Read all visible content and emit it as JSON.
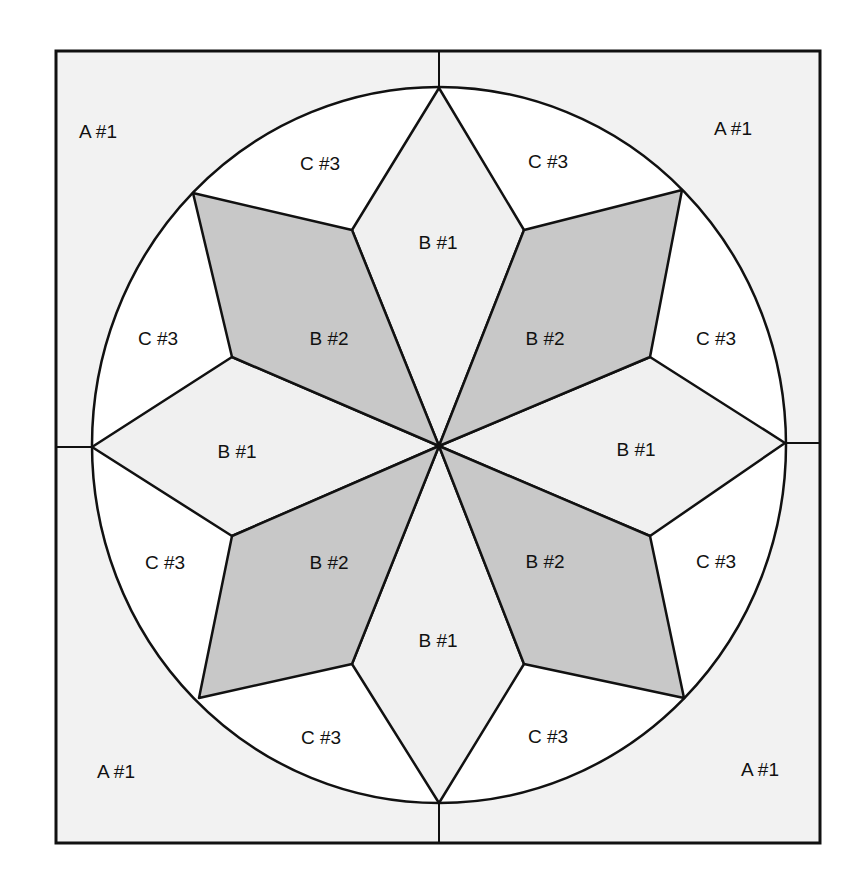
{
  "diagram": {
    "colors": {
      "background_a": "#f2f2f2",
      "piece_b1": "#f0f0f0",
      "piece_b2": "#c8c8c8",
      "piece_c3": "#ffffff",
      "outline": "#111111"
    },
    "labels": {
      "a_top_left": "A #1",
      "a_top_right": "A #1",
      "a_bottom_left": "A #1",
      "a_bottom_right": "A #1",
      "c_top_left": "C #3",
      "c_top_right": "C #3",
      "c_left_upper": "C #3",
      "c_right_upper": "C #3",
      "c_left_lower": "C #3",
      "c_right_lower": "C #3",
      "c_bottom_left": "C #3",
      "c_bottom_right": "C #3",
      "b1_top": "B #1",
      "b1_left": "B #1",
      "b1_right": "B #1",
      "b1_bottom": "B #1",
      "b2_top_left": "B #2",
      "b2_top_right": "B #2",
      "b2_bottom_left": "B #2",
      "b2_bottom_right": "B #2"
    }
  }
}
